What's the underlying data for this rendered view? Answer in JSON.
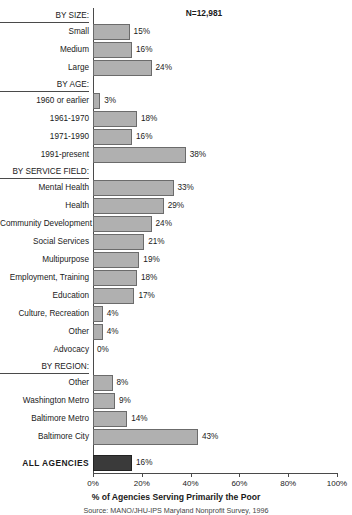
{
  "chart_data": {
    "type": "bar",
    "orientation": "horizontal",
    "title": "",
    "xlabel": "% of Agencies Serving Primarily the Poor",
    "ylabel": "",
    "xlim": [
      0,
      100
    ],
    "xticks": [
      0,
      20,
      40,
      60,
      80,
      100
    ],
    "xtick_labels": [
      "0%",
      "20%",
      "40%",
      "60%",
      "80%",
      "100%"
    ],
    "grid": false,
    "legend": false,
    "n_label": "N=12,981",
    "source": "Source: MANO/JHU-IPS Maryland Nonprofit Survey, 1996",
    "bar_color": "#b0b0b0",
    "bar_edge_color": "#6b6b6b",
    "total_bar_color": "#3a3a3a",
    "categories": [
      "Small",
      "Medium",
      "Large",
      "1960 or earlier",
      "1961-1970",
      "1971-1990",
      "1991-present",
      "Mental Health",
      "Health",
      "Community Development",
      "Social Services",
      "Multipurpose",
      "Employment, Training",
      "Education",
      "Culture, Recreation",
      "Other",
      "Advocacy",
      "Other",
      "Washington Metro",
      "Baltimore Metro",
      "Baltimore City",
      "ALL AGENCIES"
    ],
    "values": [
      15,
      16,
      24,
      3,
      18,
      16,
      38,
      33,
      29,
      24,
      21,
      19,
      18,
      17,
      4,
      4,
      0,
      8,
      9,
      14,
      43,
      16
    ],
    "groups": [
      {
        "header": "BY SIZE:",
        "rows": [
          {
            "label": "Small",
            "value": 15,
            "value_label": "15%"
          },
          {
            "label": "Medium",
            "value": 16,
            "value_label": "16%"
          },
          {
            "label": "Large",
            "value": 24,
            "value_label": "24%"
          }
        ]
      },
      {
        "header": "BY AGE:",
        "rows": [
          {
            "label": "1960 or earlier",
            "value": 3,
            "value_label": "3%"
          },
          {
            "label": "1961-1970",
            "value": 18,
            "value_label": "18%"
          },
          {
            "label": "1971-1990",
            "value": 16,
            "value_label": "16%"
          },
          {
            "label": "1991-present",
            "value": 38,
            "value_label": "38%"
          }
        ]
      },
      {
        "header": "BY SERVICE FIELD:",
        "rows": [
          {
            "label": "Mental Health",
            "value": 33,
            "value_label": "33%"
          },
          {
            "label": "Health",
            "value": 29,
            "value_label": "29%"
          },
          {
            "label": "Community Development",
            "value": 24,
            "value_label": "24%"
          },
          {
            "label": "Social Services",
            "value": 21,
            "value_label": "21%"
          },
          {
            "label": "Multipurpose",
            "value": 19,
            "value_label": "19%"
          },
          {
            "label": "Employment, Training",
            "value": 18,
            "value_label": "18%"
          },
          {
            "label": "Education",
            "value": 17,
            "value_label": "17%"
          },
          {
            "label": "Culture, Recreation",
            "value": 4,
            "value_label": "4%"
          },
          {
            "label": "Other",
            "value": 4,
            "value_label": "4%"
          },
          {
            "label": "Advocacy",
            "value": 0,
            "value_label": "0%"
          }
        ]
      },
      {
        "header": "BY REGION:",
        "rows": [
          {
            "label": "Other",
            "value": 8,
            "value_label": "8%"
          },
          {
            "label": "Washington Metro",
            "value": 9,
            "value_label": "9%"
          },
          {
            "label": "Baltimore Metro",
            "value": 14,
            "value_label": "14%"
          },
          {
            "label": "Baltimore City",
            "value": 43,
            "value_label": "43%"
          }
        ]
      }
    ],
    "total_row": {
      "label": "ALL  AGENCIES",
      "value": 16,
      "value_label": "16%"
    }
  }
}
